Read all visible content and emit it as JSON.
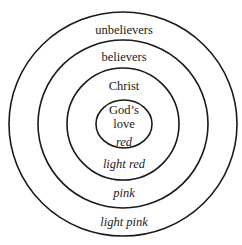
{
  "diagram": {
    "rings": [
      {
        "name": "God's love",
        "line1": "God’s",
        "line2": "love",
        "color_label": "red"
      },
      {
        "name": "Christ",
        "label": "Christ",
        "color_label": "light red"
      },
      {
        "name": "believers",
        "label": "believers",
        "color_label": "pink"
      },
      {
        "name": "unbelievers",
        "label": "unbelievers",
        "color_label": "light pink"
      }
    ],
    "stroke_color": "#1a1a1a"
  }
}
